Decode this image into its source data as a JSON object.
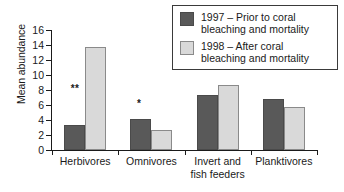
{
  "chart_data": {
    "type": "bar",
    "title": "",
    "xlabel": "",
    "ylabel": "Mean abundance",
    "ylim": [
      0,
      16
    ],
    "yticks": [
      0,
      2,
      4,
      6,
      8,
      10,
      12,
      14,
      16
    ],
    "grid": false,
    "legend_position": "top-right",
    "categories": [
      "Herbivores",
      "Omnivores",
      "Invert and\nfish feeders",
      "Planktivores"
    ],
    "series": [
      {
        "name": "1997 – Prior to coral bleaching and mortality",
        "color": "#595959",
        "values": [
          3.3,
          4.1,
          7.3,
          6.8
        ]
      },
      {
        "name": "1998 – After coral bleaching and mortality",
        "color": "#d9d9d9",
        "values": [
          13.8,
          2.7,
          8.7,
          5.8
        ]
      }
    ],
    "annotations": [
      {
        "category": "Herbivores",
        "text": "**",
        "value": 8.2
      },
      {
        "category": "Omnivores",
        "text": "*",
        "value": 6.1
      }
    ]
  },
  "legend": {
    "items": [
      {
        "swatch": "dark",
        "label": "1997 – Prior to coral\nbleaching and mortality"
      },
      {
        "swatch": "light",
        "label": "1998 – After coral\nbleaching and mortality"
      }
    ]
  },
  "axis": {
    "y_title": "Mean abundance",
    "y_tick_labels": [
      "16",
      "14",
      "12",
      "10",
      "8",
      "6",
      "4",
      "2",
      "0"
    ]
  }
}
